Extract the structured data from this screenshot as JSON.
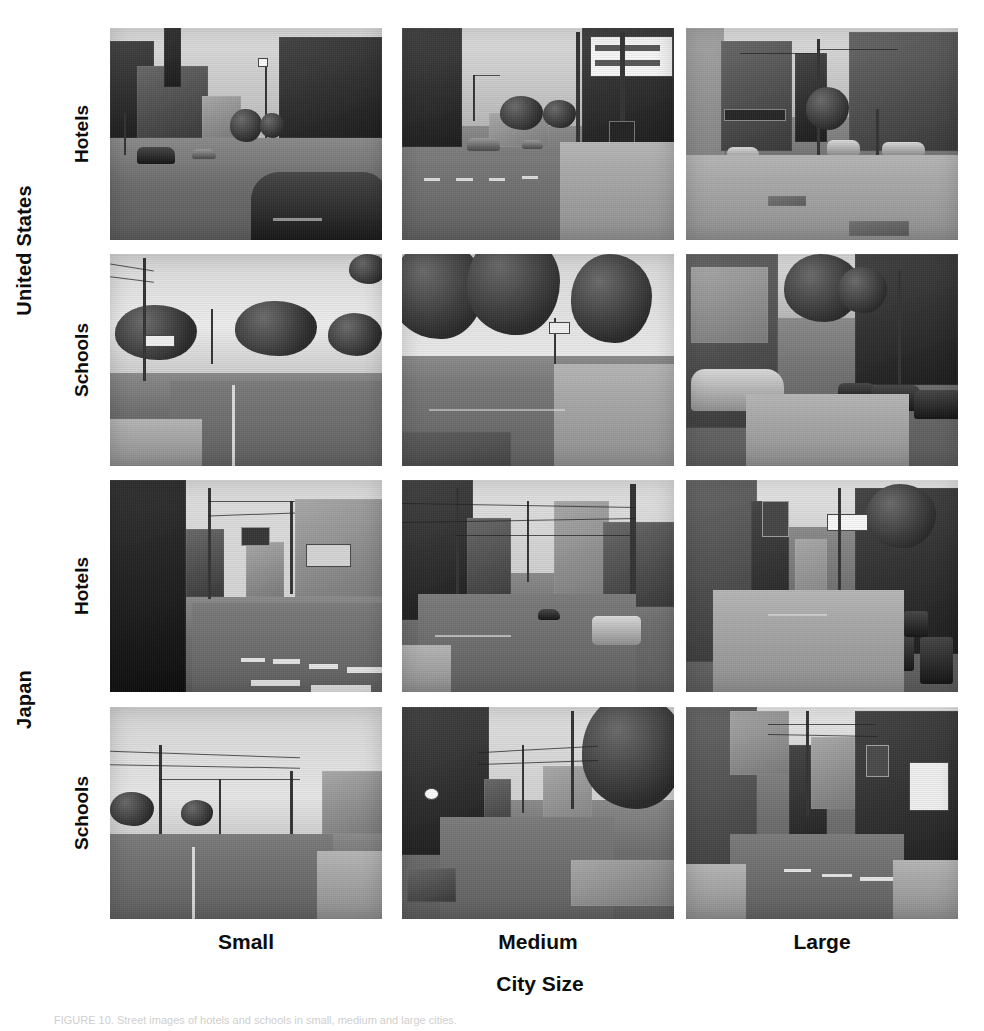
{
  "figure": {
    "axis_title": "City Size",
    "caption": "FIGURE 10. Street images of hotels and schools in small, medium and large cities."
  },
  "rows": [
    {
      "country": "United States",
      "venue": "Hotels"
    },
    {
      "country": "United States",
      "venue": "Schools"
    },
    {
      "country": "Japan",
      "venue": "Hotels"
    },
    {
      "country": "Japan",
      "venue": "Schools"
    }
  ],
  "country_groups": [
    {
      "label": "United States"
    },
    {
      "label": "Japan"
    }
  ],
  "venue_labels": [
    {
      "label": "Hotels"
    },
    {
      "label": "Schools"
    },
    {
      "label": "Hotels"
    },
    {
      "label": "Schools"
    }
  ],
  "columns": [
    {
      "label": "Small"
    },
    {
      "label": "Medium"
    },
    {
      "label": "Large"
    }
  ],
  "cells": [
    {
      "row": "United States / Hotels",
      "column": "Small",
      "description": "Small-town main street with brick buildings, clock tower, flagpole and a dark parked car in the foreground"
    },
    {
      "row": "United States / Hotels",
      "column": "Medium",
      "description": "Medium city downtown street with a theater marquee, crosswalk signal and wide asphalt road"
    },
    {
      "row": "United States / Hotels",
      "column": "Large",
      "description": "Large city intersection with tall masonry buildings, awnings, a white van and wide sidewalk"
    },
    {
      "row": "United States / Schools",
      "column": "Small",
      "description": "Small-town residential road lined with large trees, utility poles and a painted lane line"
    },
    {
      "row": "United States / Schools",
      "column": "Medium",
      "description": "Medium city tree-lined street with grass verge, sidewalk and a distant intersection"
    },
    {
      "row": "United States / Schools",
      "column": "Large",
      "description": "Large city sidewalk with parked cars on both sides and a long brick school building"
    },
    {
      "row": "Japan / Hotels",
      "column": "Small",
      "description": "Narrow Japanese small-town street with concrete wall, overhead wires and a zebra crossing"
    },
    {
      "row": "Japan / Hotels",
      "column": "Medium",
      "description": "Japanese medium-city street with low shops, dense utility poles and a white van"
    },
    {
      "row": "Japan / Hotels",
      "column": "Large",
      "description": "Japanese large-city shopping street with signage, trees and rows of parked bicycles"
    },
    {
      "row": "Japan / Schools",
      "column": "Small",
      "description": "Rural Japanese road with open sky, utility poles, low wall and a straight asphalt lane"
    },
    {
      "row": "Japan / Schools",
      "column": "Medium",
      "description": "Japanese medium-city lane with wooden houses, a stone retaining wall and a large tree"
    },
    {
      "row": "Japan / Schools",
      "column": "Large",
      "description": "Japanese large-city street with mid-rise concrete buildings, shop signs and crosswalk markings"
    }
  ],
  "colors": {
    "background": "#ffffff",
    "text": "#0d0d0d"
  }
}
